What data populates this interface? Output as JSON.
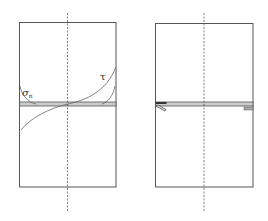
{
  "figure": {
    "panels": [
      {
        "id": "left",
        "description": "Bonded joint with stress distributions along bond line",
        "box": {
          "x": 19,
          "y": 22,
          "w": 97,
          "h": 165
        },
        "axis_x": 68,
        "bond_layer": {
          "y": 102,
          "h": 4
        },
        "labels": {
          "sigma_symbol": "σ",
          "sigma_subscript": "n",
          "tau_symbol": "τ"
        }
      },
      {
        "id": "right",
        "description": "Bonded joint with crack initiation at edge",
        "box": {
          "x": 155,
          "y": 23,
          "w": 98,
          "h": 164
        },
        "axis_x": 204,
        "bond_layer": {
          "y": 102,
          "h": 4
        }
      }
    ],
    "colors": {
      "line": "#555555",
      "layer_fill": "#cccccc",
      "dash": "#444444",
      "curve": "#666666"
    }
  }
}
